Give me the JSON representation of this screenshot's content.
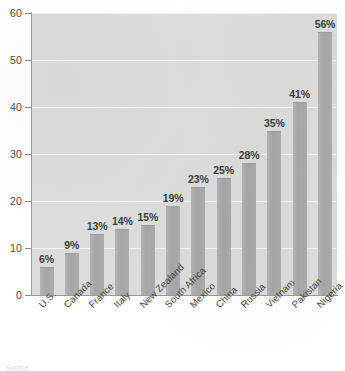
{
  "chart_data": {
    "type": "bar",
    "title": "",
    "subtitle": "",
    "xlabel": "",
    "ylabel": "",
    "ylim": [
      0,
      60
    ],
    "ytick_values": [
      0,
      10,
      20,
      30,
      40,
      50,
      60
    ],
    "ytick_labels": [
      "0",
      "10",
      "20",
      "30",
      "40",
      "50",
      "60"
    ],
    "grid": true,
    "grid_axis": "y",
    "legend": false,
    "legend_position": "none",
    "orientation": "vertical",
    "categories": [
      "U.S.",
      "Canada",
      "France",
      "Italy",
      "New Zealand",
      "South Africa",
      "Mexico",
      "China",
      "Russia",
      "Vietnam",
      "Pakistan",
      "Nigeria"
    ],
    "values": [
      6,
      9,
      13,
      14,
      15,
      19,
      23,
      25,
      28,
      35,
      41,
      56
    ],
    "data_labels": [
      "6%",
      "9%",
      "13%",
      "14%",
      "15%",
      "19%",
      "23%",
      "25%",
      "28%",
      "35%",
      "41%",
      "56%"
    ],
    "colors": {
      "bar": "#a8a8a8",
      "bar_edge": "#9e9e9e",
      "plot_background": "#dcdcdc",
      "gridline": "#f4f4f4",
      "axis": "#9a9a9a",
      "tick_label": "#4a4a4a",
      "data_label": "#3d3d3d",
      "category_label": "#454545",
      "page_background": "#ffffff"
    }
  },
  "footer": {
    "source_note": "Source:"
  }
}
